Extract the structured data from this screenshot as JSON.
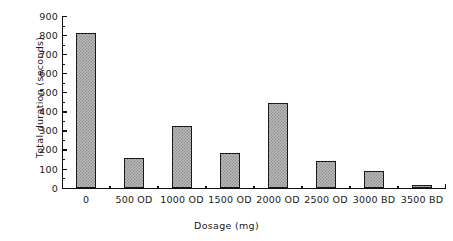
{
  "chart_data": {
    "type": "bar",
    "title": "",
    "xlabel": "Dosage (mg)",
    "ylabel": "Total duration (seconds)",
    "categories": [
      "0",
      "500 OD",
      "1000 OD",
      "1500 OD",
      "2000 OD",
      "2500 OD",
      "3000 BD",
      "3500 BD"
    ],
    "values": [
      810,
      155,
      322,
      182,
      443,
      140,
      88,
      8
    ],
    "ylim": [
      0,
      900
    ],
    "ytick_labels": [
      "0",
      "100",
      "200",
      "300",
      "400",
      "500",
      "600",
      "700",
      "800",
      "900"
    ],
    "ytick_values": [
      0,
      100,
      200,
      300,
      400,
      500,
      600,
      700,
      800,
      900
    ],
    "yminor_values": [
      50,
      150,
      250,
      350,
      450,
      550,
      650,
      750,
      850
    ],
    "grid": false,
    "legend": null,
    "bar_fill_color": "#b9b9b9",
    "bar_pattern_color": "#8f8f8f",
    "bar_edge_color": "#1a1a1a",
    "axis_color": "#111111",
    "background_color": "#ffffff"
  }
}
